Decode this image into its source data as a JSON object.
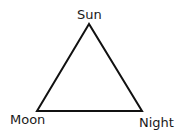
{
  "diagram": {
    "type": "triangle",
    "vertices": [
      {
        "label": "Sun",
        "position": "top"
      },
      {
        "label": "Moon",
        "position": "bottom-left"
      },
      {
        "label": "Night",
        "position": "bottom-right"
      }
    ],
    "stroke_color": "#111111",
    "background": "#ffffff"
  }
}
